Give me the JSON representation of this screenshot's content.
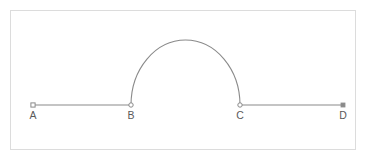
{
  "figure": {
    "title": "",
    "frame": {
      "x": 10.5,
      "y": 10.5,
      "width": 345,
      "height": 139,
      "stroke_color": "#dcdcdc",
      "fill_color": "#ffffff",
      "stroke_width": 1
    },
    "style": {
      "line_color": "#8a8a8a",
      "line_width": 1,
      "marker_color": "#8a8a8a",
      "marker_fill": "#ffffff",
      "label_color": "#5a5a5a",
      "background": "#ffffff"
    },
    "baseline_y": 105,
    "label_y": 119,
    "points": [
      {
        "name": "A",
        "label": "A",
        "x": 33,
        "y": 105,
        "marker": "square-open"
      },
      {
        "name": "B",
        "label": "B",
        "x": 131,
        "y": 105,
        "marker": "circle-open"
      },
      {
        "name": "C",
        "label": "C",
        "x": 240,
        "y": 105,
        "marker": "circle-open"
      },
      {
        "name": "D",
        "label": "D",
        "x": 343,
        "y": 105,
        "marker": "square-filled"
      }
    ],
    "segments": [
      {
        "name": "segment-AB",
        "from": "A",
        "to": "B",
        "x1": 33,
        "x2": 131,
        "y": 105
      },
      {
        "name": "segment-CD",
        "from": "C",
        "to": "D",
        "x1": 240,
        "x2": 343,
        "y": 105
      }
    ],
    "arc": {
      "name": "arc-BC",
      "from": "B",
      "to": "C",
      "center_x": 185.5,
      "center_y": 105,
      "radius_x": 54.5,
      "radius_y": 65,
      "start_x": 131,
      "start_y": 105,
      "end_x": 240,
      "end_y": 105,
      "apex_x": 185.5,
      "apex_y": 40,
      "sweep": "upper-half"
    }
  }
}
